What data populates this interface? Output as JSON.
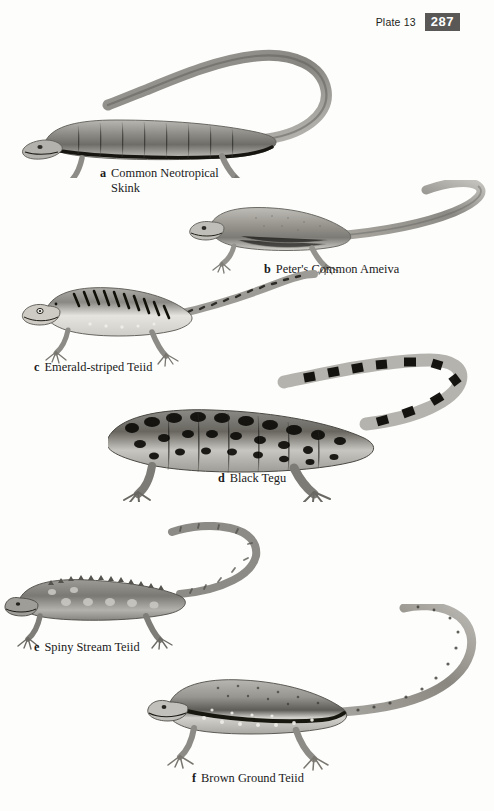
{
  "page": {
    "width": 494,
    "height": 811,
    "background_color": "#fdfdfc",
    "kind": "field-guide-plate"
  },
  "header": {
    "plate_label": "Plate 13",
    "page_number": "287",
    "badge_bg_color": "#595857",
    "badge_text_color": "#ffffff"
  },
  "figures": [
    {
      "tag": "a",
      "name": "Common Neotropical Skink",
      "caption_line1": "Common Neotropical",
      "caption_line2": "Skink",
      "body_tone": "#8e8d88",
      "belly_tone": "#d9d8d2",
      "pattern": "smooth glossy scales with dark lateral stripe",
      "tail_direction": "long tail loops up and over to the left",
      "orientation": "head-left"
    },
    {
      "tag": "b",
      "name": "Peter's Common Ameiva",
      "caption_line1": "Peter's Common Ameiva",
      "caption_line2": "",
      "body_tone": "#9a9892",
      "belly_tone": "#dedcd6",
      "pattern": "fine granular scales, pale flanks, faint speckling",
      "tail_direction": "tail sweeps right then curves upward",
      "orientation": "head-left"
    },
    {
      "tag": "c",
      "name": "Emerald-striped Teiid",
      "caption_line1": "Emerald-striped Teiid",
      "caption_line2": "",
      "body_tone": "#8b8a85",
      "belly_tone": "#e3e1dc",
      "pattern": "bold dark chevrons along pale dorsolateral stripe, mottled tail",
      "tail_direction": "tail rises to upper right",
      "orientation": "head-left"
    },
    {
      "tag": "d",
      "name": "Black Tegu",
      "caption_line1": "Black Tegu",
      "caption_line2": "",
      "body_tone": "#6f6e6a",
      "belly_tone": "#d2d0ca",
      "pattern": "heavy black blotching and reticulation, boldly banded tail",
      "tail_direction": "thick tail arcs up and back to the left",
      "orientation": "head-left"
    },
    {
      "tag": "e",
      "name": "Spiny Stream Teiid",
      "caption_line1": "Spiny Stream Teiid",
      "caption_line2": "",
      "body_tone": "#86857f",
      "belly_tone": "#cfcdc7",
      "pattern": "serrated dorsal crest, pale rounded blotches, keeled tail",
      "tail_direction": "tail sweeps up to the right",
      "orientation": "head-left"
    },
    {
      "tag": "f",
      "name": "Brown Ground Teiid",
      "caption_line1": "Brown Ground Teiid",
      "caption_line2": "",
      "body_tone": "#918f89",
      "belly_tone": "#dddbd5",
      "pattern": "dark lateral band edged with pale spots, speckled tail",
      "tail_direction": "long tail arcs up and to the right",
      "orientation": "head-left"
    }
  ]
}
